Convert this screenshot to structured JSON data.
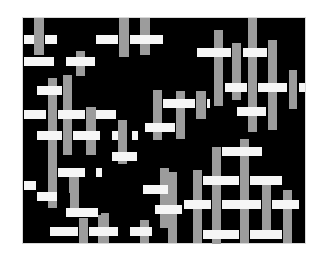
{
  "figure": {
    "description": "Abstract weave pattern of white horizontal bars and gray vertical bars on a black panel",
    "colors": {
      "background": "#ffffff",
      "panel": "#000000",
      "vertical_bar": "#9c9c9c",
      "horizontal_bar": "#f6f6f6"
    },
    "panel": {
      "x": 23,
      "y": 18,
      "w": 282,
      "h": 225
    }
  },
  "vertical_bars": [
    {
      "x": 34,
      "y": 18,
      "w": 10,
      "h": 37
    },
    {
      "x": 119,
      "y": 18,
      "w": 10,
      "h": 39
    },
    {
      "x": 140,
      "y": 18,
      "w": 10,
      "h": 37
    },
    {
      "x": 76,
      "y": 51,
      "w": 9,
      "h": 25
    },
    {
      "x": 48,
      "y": 78,
      "w": 9,
      "h": 64
    },
    {
      "x": 63,
      "y": 75,
      "w": 9,
      "h": 80
    },
    {
      "x": 86,
      "y": 107,
      "w": 10,
      "h": 48
    },
    {
      "x": 153,
      "y": 90,
      "w": 9,
      "h": 50
    },
    {
      "x": 214,
      "y": 30,
      "w": 9,
      "h": 76
    },
    {
      "x": 232,
      "y": 43,
      "w": 9,
      "h": 57
    },
    {
      "x": 248,
      "y": 18,
      "w": 9,
      "h": 114
    },
    {
      "x": 268,
      "y": 40,
      "w": 9,
      "h": 90
    },
    {
      "x": 289,
      "y": 70,
      "w": 8,
      "h": 39
    },
    {
      "x": 176,
      "y": 91,
      "w": 9,
      "h": 48
    },
    {
      "x": 196,
      "y": 91,
      "w": 10,
      "h": 28
    },
    {
      "x": 118,
      "y": 120,
      "w": 9,
      "h": 44
    },
    {
      "x": 69,
      "y": 168,
      "w": 9,
      "h": 25
    },
    {
      "x": 48,
      "y": 142,
      "w": 9,
      "h": 66
    },
    {
      "x": 160,
      "y": 168,
      "w": 9,
      "h": 60
    },
    {
      "x": 212,
      "y": 147,
      "w": 9,
      "h": 97
    },
    {
      "x": 240,
      "y": 139,
      "w": 9,
      "h": 104
    },
    {
      "x": 262,
      "y": 180,
      "w": 9,
      "h": 50
    },
    {
      "x": 283,
      "y": 190,
      "w": 9,
      "h": 53
    },
    {
      "x": 193,
      "y": 170,
      "w": 9,
      "h": 73
    },
    {
      "x": 168,
      "y": 172,
      "w": 9,
      "h": 71
    },
    {
      "x": 101,
      "y": 213,
      "w": 8,
      "h": 30
    },
    {
      "x": 98,
      "y": 215,
      "w": 8,
      "h": 28
    },
    {
      "x": 79,
      "y": 218,
      "w": 9,
      "h": 25
    },
    {
      "x": 140,
      "y": 220,
      "w": 9,
      "h": 23
    },
    {
      "x": 70,
      "y": 175,
      "w": 9,
      "h": 36
    }
  ],
  "horizontal_bars": [
    {
      "x": 24,
      "y": 35,
      "w": 10,
      "h": 9
    },
    {
      "x": 45,
      "y": 35,
      "w": 12,
      "h": 9
    },
    {
      "x": 96,
      "y": 35,
      "w": 22,
      "h": 9
    },
    {
      "x": 130,
      "y": 35,
      "w": 33,
      "h": 9
    },
    {
      "x": 24,
      "y": 57,
      "w": 30,
      "h": 9
    },
    {
      "x": 66,
      "y": 57,
      "w": 29,
      "h": 9
    },
    {
      "x": 37,
      "y": 86,
      "w": 25,
      "h": 9
    },
    {
      "x": 24,
      "y": 110,
      "w": 22,
      "h": 9
    },
    {
      "x": 58,
      "y": 110,
      "w": 27,
      "h": 9
    },
    {
      "x": 96,
      "y": 110,
      "w": 20,
      "h": 9
    },
    {
      "x": 197,
      "y": 48,
      "w": 34,
      "h": 9
    },
    {
      "x": 243,
      "y": 48,
      "w": 24,
      "h": 9
    },
    {
      "x": 225,
      "y": 83,
      "w": 22,
      "h": 9
    },
    {
      "x": 258,
      "y": 83,
      "w": 29,
      "h": 9
    },
    {
      "x": 299,
      "y": 83,
      "w": 6,
      "h": 9
    },
    {
      "x": 163,
      "y": 99,
      "w": 32,
      "h": 9
    },
    {
      "x": 207,
      "y": 99,
      "w": 3,
      "h": 9
    },
    {
      "x": 145,
      "y": 123,
      "w": 30,
      "h": 9
    },
    {
      "x": 237,
      "y": 107,
      "w": 29,
      "h": 9
    },
    {
      "x": 37,
      "y": 131,
      "w": 25,
      "h": 9
    },
    {
      "x": 73,
      "y": 131,
      "w": 27,
      "h": 9
    },
    {
      "x": 112,
      "y": 131,
      "w": 6,
      "h": 9
    },
    {
      "x": 132,
      "y": 131,
      "w": 6,
      "h": 9
    },
    {
      "x": 112,
      "y": 152,
      "w": 25,
      "h": 9
    },
    {
      "x": 58,
      "y": 168,
      "w": 27,
      "h": 9
    },
    {
      "x": 96,
      "y": 168,
      "w": 6,
      "h": 9
    },
    {
      "x": 24,
      "y": 181,
      "w": 12,
      "h": 9
    },
    {
      "x": 37,
      "y": 192,
      "w": 20,
      "h": 9
    },
    {
      "x": 143,
      "y": 185,
      "w": 25,
      "h": 9
    },
    {
      "x": 155,
      "y": 205,
      "w": 27,
      "h": 9
    },
    {
      "x": 66,
      "y": 208,
      "w": 32,
      "h": 9
    },
    {
      "x": 50,
      "y": 227,
      "w": 28,
      "h": 9
    },
    {
      "x": 89,
      "y": 227,
      "w": 29,
      "h": 9
    },
    {
      "x": 130,
      "y": 227,
      "w": 22,
      "h": 9
    },
    {
      "x": 222,
      "y": 147,
      "w": 40,
      "h": 9
    },
    {
      "x": 203,
      "y": 176,
      "w": 36,
      "h": 9
    },
    {
      "x": 250,
      "y": 176,
      "w": 32,
      "h": 9
    },
    {
      "x": 184,
      "y": 200,
      "w": 27,
      "h": 9
    },
    {
      "x": 222,
      "y": 200,
      "w": 39,
      "h": 9
    },
    {
      "x": 272,
      "y": 200,
      "w": 27,
      "h": 9
    },
    {
      "x": 203,
      "y": 230,
      "w": 36,
      "h": 9
    },
    {
      "x": 250,
      "y": 230,
      "w": 32,
      "h": 9
    }
  ]
}
